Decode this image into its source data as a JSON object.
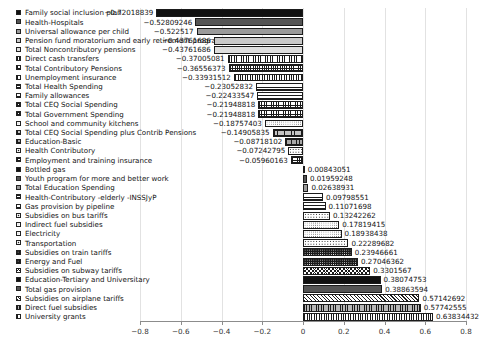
{
  "chart_data": {
    "type": "bar",
    "orientation": "horizontal",
    "title": "",
    "xlabel": "",
    "ylabel": "",
    "xlim": [
      -0.8,
      0.8
    ],
    "grid": true,
    "legend_position": "left-inline",
    "xticks": [
      "-0.8",
      "-0.6",
      "-0.4",
      "-0.2",
      "0",
      "0.2",
      "0.4",
      "0.6",
      "0.8"
    ],
    "xtick_values": [
      -0.8,
      -0.6,
      -0.4,
      -0.2,
      0,
      0.2,
      0.4,
      0.6,
      0.8
    ],
    "categories": [
      "Family social inclusion plan",
      "Health-Hospitals",
      "Universal allowance per child",
      "Pension fund moratorium and early retirement program",
      "Total Noncontributory pensions",
      "Direct cash transfers",
      "Total Contributory Pensions",
      "Unemployment insurance",
      "Total Health Spending",
      "Family allowances",
      "Total CEQ Social Spending",
      "Total Government Spending",
      "School and community kitchens",
      "Total CEQ Social Spending plus Contrib Pensions",
      "Education-Basic",
      "Health Contributory",
      "Employment and training insurance",
      "Bottled gas",
      "Youth program for more and better work",
      "Total Education Spending",
      "Health-Contributory -elderly -INSSJyP",
      "Gas provision by pipeline",
      "Subsidies on bus tariffs",
      "Indirect fuel subsidies",
      "Electricity",
      "Transportation",
      "Subsidies on train tariffs",
      "Energy and Fuel",
      "Subsidies on subway tariffs",
      "Education-Tertiary and Universitary",
      "Total gas provision",
      "Subsidies on airplane tariffs",
      "Direct fuel subsidies",
      "University grants"
    ],
    "values": [
      -0.72018839,
      -0.52809246,
      -0.522517,
      -0.43761686,
      -0.43761686,
      -0.37005081,
      -0.36556373,
      -0.33931512,
      -0.23052832,
      -0.22433547,
      -0.21948818,
      -0.21948818,
      -0.18757403,
      -0.14905835,
      -0.08718102,
      -0.07242795,
      -0.05960163,
      0.00843051,
      0.01959248,
      0.02638931,
      0.09798551,
      0.11071698,
      0.13242262,
      0.17819415,
      0.18938438,
      0.22289682,
      0.23946661,
      0.27046362,
      0.3301567,
      0.38074753,
      0.38863594,
      0.57142692,
      0.57742555,
      0.63834432
    ],
    "value_labels": [
      "-0.72018839",
      "-0.52809246",
      "-0.522517",
      "-0.43761686",
      "-0.43761686",
      "-0.37005081",
      "-0.36556373",
      "-0.33931512",
      "-0.23052832",
      "-0.22433547",
      "-0.21948818",
      "-0.21948818",
      "-0.18757403",
      "-0.14905835",
      "-0.08718102",
      "-0.07242795",
      "-0.05960163",
      "0.00843051",
      "0.01959248",
      "0.02638931",
      "0.09798551",
      "0.11071698",
      "0.13242262",
      "0.17819415",
      "0.18938438",
      "0.22289682",
      "0.23946661",
      "0.27046362",
      "0.3301567",
      "0.38074753",
      "0.38863594",
      "0.57142692",
      "0.57742555",
      "0.63834432"
    ],
    "patterns": [
      "p-solid-dark",
      "p-solid-mid",
      "p-solid-light",
      "p-solid-pale",
      "p-solid-pale2",
      "p-vert",
      "p-cross-dense",
      "p-vert-dense",
      "p-horiz",
      "p-horiz-wide",
      "p-cross",
      "p-cross",
      "p-dots",
      "p-brick",
      "p-grid-gray",
      "p-dots-coarse",
      "p-cross-dense",
      "p-solid-dark",
      "p-solid-mid",
      "p-solid-light",
      "p-horiz",
      "p-horiz-wide",
      "p-dots-coarse",
      "p-dots",
      "p-dots",
      "p-dots-coarse",
      "p-dots-dark",
      "p-dots-dark",
      "p-diagcross",
      "p-solid-dark",
      "p-solid-mid",
      "p-diag",
      "p-vert-gray",
      "p-vert-dense"
    ]
  }
}
